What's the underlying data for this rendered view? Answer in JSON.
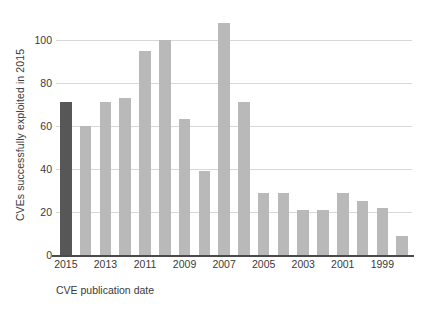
{
  "chart_data": {
    "type": "bar",
    "title": "",
    "xlabel": "CVE publication date",
    "ylabel": "CVEs successfully exploited in 2015",
    "categories": [
      "2015",
      "2014",
      "2013",
      "2012",
      "2011",
      "2010",
      "2009",
      "2008",
      "2007",
      "2006",
      "2005",
      "2004",
      "2003",
      "2002",
      "2001",
      "2000",
      "1999",
      "1998"
    ],
    "values": [
      71,
      60,
      71,
      73,
      95,
      100,
      63,
      39,
      108,
      71,
      29,
      29,
      21,
      21,
      29,
      25,
      22,
      9
    ],
    "xtick_labels": [
      "2015",
      "2013",
      "2011",
      "2009",
      "2007",
      "2005",
      "2003",
      "2001",
      "1999"
    ],
    "ytick_labels": [
      "0",
      "20",
      "40",
      "60",
      "80",
      "100"
    ],
    "ytick_values": [
      0,
      20,
      40,
      60,
      80,
      100
    ],
    "ylim": [
      0,
      112
    ],
    "grid": "horizontal",
    "legend": "none",
    "highlight_category": "2015",
    "colors": {
      "bar": "#b9b9b9",
      "bar_highlight": "#575757",
      "gridline": "#d8d8d8",
      "axis": "#4a4a4a",
      "text": "#3a3a3a",
      "background": "#ffffff"
    }
  }
}
